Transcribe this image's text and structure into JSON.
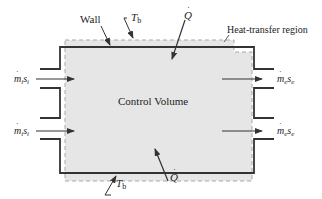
{
  "diagram": {
    "center_label": "Control Volume",
    "labels": {
      "wall": "Wall",
      "boundary_temp_top": "T",
      "boundary_temp_top_sub": "b",
      "boundary_temp_bottom": "T",
      "boundary_temp_bottom_sub": "b",
      "heat_top": "Q",
      "heat_bottom": "Q",
      "heat_transfer_region": "Heat-transfer region"
    },
    "inlets": [
      {
        "m": "m",
        "sub": "i",
        "s": "s",
        "s_sub": "i"
      },
      {
        "m": "m",
        "sub": "i",
        "s": "s",
        "s_sub": "i"
      }
    ],
    "outlets": [
      {
        "m": "m",
        "sub": "e",
        "s": "s",
        "s_sub": "e"
      },
      {
        "m": "m",
        "sub": "e",
        "s": "s",
        "s_sub": "e"
      }
    ],
    "colors": {
      "fill": "#e6e6e6",
      "wall": "#333333",
      "dashed": "#a8a8a8",
      "arrow": "#333333",
      "text": "#222222"
    }
  }
}
